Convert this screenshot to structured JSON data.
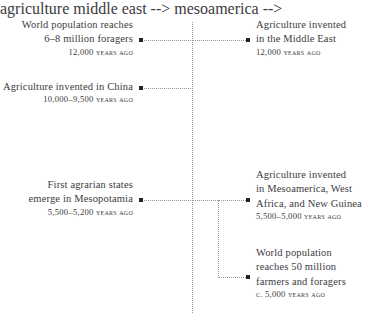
{
  "figure": {
    "background_color": "#ffffff",
    "text_color": "#3b3b42",
    "rule_color": "#9a9aa2",
    "dot_color": "#22222a"
  },
  "axis": {
    "name": "central-dotted-timeline-axis",
    "style": "dotted-vertical"
  },
  "entries": [
    {
      "id": "world-population-foragers",
      "side": "left",
      "lines": [
        "World population reaches",
        "6–8 million foragers"
      ],
      "date": "12,000 years ago"
    },
    {
      "id": "agriculture-middle-east",
      "side": "right",
      "lines": [
        "Agriculture invented",
        "in the Middle East"
      ],
      "date": "12,000 years ago"
    },
    {
      "id": "agriculture-china",
      "side": "left",
      "lines": [
        "Agriculture invented in China"
      ],
      "date": "10,000–9,500 years ago"
    },
    {
      "id": "first-agrarian-states-mesopotamia",
      "side": "left",
      "lines": [
        "First agrarian states",
        "emerge in Mesopotamia"
      ],
      "date": "5,500–5,200 years ago"
    },
    {
      "id": "agriculture-mesoamerica-west-africa-new-guinea",
      "side": "right",
      "lines": [
        "Agriculture invented",
        "in Mesoamerica, West",
        "Africa, and New Guinea"
      ],
      "date": "5,500–5,000 years ago"
    },
    {
      "id": "world-population-50-million",
      "side": "right",
      "lines": [
        "World population",
        "reaches 50 million",
        "farmers and foragers"
      ],
      "date": "c. 5,000 years ago"
    }
  ]
}
